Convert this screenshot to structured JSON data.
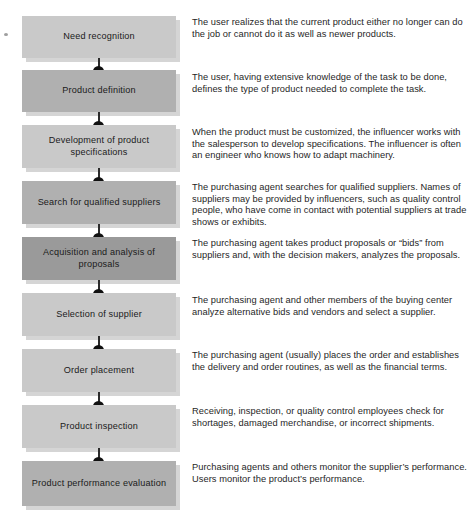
{
  "diagram": {
    "type": "vertical-flowchart-with-annotations",
    "stage_count": 9,
    "stages": [
      {
        "index": 1,
        "label": "Need recognition",
        "tone": "light",
        "description": "The user realizes that the current product either no longer can do the job or cannot do it as well as newer products."
      },
      {
        "index": 2,
        "label": "Product definition",
        "tone": "mid",
        "description": "The user, having extensive knowledge of the task to be done, defines the type of product needed to complete the task."
      },
      {
        "index": 3,
        "label": "Development of product specifications",
        "tone": "light",
        "description": "When the product must be customized, the influencer works with the salesperson to develop specifications. The influencer is often an engineer who knows how to adapt machinery."
      },
      {
        "index": 4,
        "label": "Search for qualified suppliers",
        "tone": "mid",
        "description": "The purchasing agent searches for qualified suppliers. Names of suppliers may be provided by influencers, such as quality control people, who have come in contact with potential suppliers at trade shows or exhibits."
      },
      {
        "index": 5,
        "label": "Acquisition and analysis of proposals",
        "tone": "dark",
        "description": "The purchasing agent takes product proposals or “bids” from suppliers and, with the decision makers, analyzes the proposals."
      },
      {
        "index": 6,
        "label": "Selection of supplier",
        "tone": "light",
        "description": "The purchasing agent and other members of the buying center analyze alternative bids and vendors and select a supplier."
      },
      {
        "index": 7,
        "label": "Order placement",
        "tone": "light",
        "description": "The purchasing agent (usually) places the order and establishes the delivery and order routines, as well as the financial terms."
      },
      {
        "index": 8,
        "label": "Product inspection",
        "tone": "light",
        "description": "Receiving, inspection, or quality control employees check for shortages, damaged merchandise, or incorrect shipments."
      },
      {
        "index": 9,
        "label": "Product performance evaluation",
        "tone": "mid",
        "description": "Purchasing agents and others monitor the supplier’s performance. Users monitor the product’s performance."
      }
    ]
  },
  "colors": {
    "box_light": "#c9c9c9",
    "box_mid": "#b0b0b0",
    "box_dark": "#9a9a9a",
    "connector": "#2b2b2b",
    "text": "#1c1c1c",
    "background": "#ffffff"
  }
}
